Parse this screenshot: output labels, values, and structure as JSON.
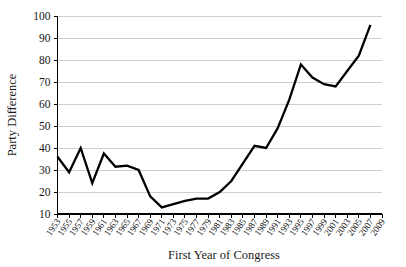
{
  "chart_data": {
    "type": "line",
    "title": "",
    "xlabel": "First Year of Congress",
    "ylabel": "Party Difference",
    "xlim": [
      1953,
      2009
    ],
    "ylim": [
      10,
      100
    ],
    "grid": true,
    "legend": false,
    "y_ticks": [
      10,
      20,
      30,
      40,
      50,
      60,
      70,
      80,
      90,
      100
    ],
    "x_ticks": [
      "1953",
      "1955",
      "1957",
      "1959",
      "1961",
      "1963",
      "1965",
      "1967",
      "1969",
      "1971",
      "1973",
      "1975",
      "1977",
      "1979",
      "1981",
      "1983",
      "1985",
      "1987",
      "1989",
      "1991",
      "1993",
      "1995",
      "1997",
      "1999",
      "2001",
      "2003",
      "2005",
      "2007",
      "2009"
    ],
    "x": [
      1953,
      1955,
      1957,
      1959,
      1961,
      1963,
      1965,
      1967,
      1969,
      1971,
      1973,
      1975,
      1977,
      1979,
      1981,
      1983,
      1985,
      1987,
      1989,
      1991,
      1993,
      1995,
      1997,
      1999,
      2001,
      2003,
      2005,
      2007
    ],
    "values": [
      36,
      29,
      40,
      24,
      37.5,
      31.5,
      32,
      30,
      18,
      13,
      14.5,
      16,
      17,
      17,
      20,
      25,
      33,
      41,
      40,
      49,
      62,
      78,
      72,
      69,
      68,
      75,
      82,
      96
    ],
    "series": [
      {
        "name": "Party Difference",
        "values": [
          36,
          29,
          40,
          24,
          37.5,
          31.5,
          32,
          30,
          18,
          13,
          14.5,
          16,
          17,
          17,
          20,
          25,
          33,
          41,
          40,
          49,
          62,
          78,
          72,
          69,
          68,
          75,
          82,
          96
        ]
      }
    ],
    "line_color": "#000000"
  }
}
